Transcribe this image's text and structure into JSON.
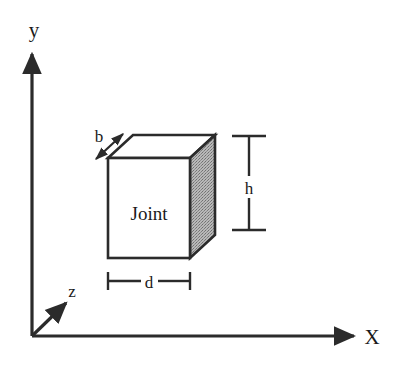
{
  "figure": {
    "background_color": "#ffffff",
    "line_color": "#2b2b2b",
    "text_color": "#1a1a1a",
    "shaded_face_color": "#a9a9a9",
    "white_face_color": "#ffffff"
  },
  "axes": {
    "origin": {
      "x": 32,
      "y": 336
    },
    "y_axis": {
      "label": "y",
      "direction": "up",
      "label_x": 34,
      "label_y": 30,
      "tip_x": 32,
      "tip_y": 50
    },
    "x_axis": {
      "label": "X",
      "direction": "right",
      "label_x": 368,
      "label_y": 344,
      "tip_x": 358,
      "tip_y": 336
    },
    "z_axis": {
      "label": "z",
      "direction": "up-right-diagonal",
      "label_x": 68,
      "label_y": 298,
      "tip_x": 70,
      "tip_y": 299
    }
  },
  "solid": {
    "name": "Joint",
    "face_label": "Joint",
    "face_label_x": 149,
    "face_label_y": 220,
    "front_face": {
      "left": 108,
      "top": 158,
      "right": 190,
      "bottom": 258,
      "fill": "#ffffff"
    },
    "depth_offset": {
      "dx": 25,
      "dy": -23
    },
    "right_face_fill": "#a9a9a9",
    "top_face_fill": "#ffffff"
  },
  "dimensions": [
    {
      "id": "b",
      "label": "b",
      "orientation": "diagonal",
      "description": "breadth along the top-left receding edge",
      "label_x": 99,
      "label_y": 141,
      "start_x": 95,
      "start_y": 160,
      "end_x": 124,
      "end_y": 133
    },
    {
      "id": "h",
      "label": "h",
      "orientation": "vertical",
      "description": "height of the joint element",
      "label_x": 249,
      "label_y": 190,
      "line_x": 249,
      "top_y": 136,
      "bottom_y": 230,
      "tick_half_width": 17
    },
    {
      "id": "d",
      "label": "d",
      "orientation": "horizontal",
      "description": "depth/width of the joint element front face",
      "label_x": 149,
      "label_y": 287,
      "line_y": 281,
      "left_x": 108,
      "right_x": 190,
      "tick_half_height": 9
    }
  ],
  "icons": {
    "y_axis_arrow": "arrow-up-icon",
    "x_axis_arrow": "arrow-right-icon",
    "z_axis_arrow": "arrow-diagonal-icon",
    "dimension_arrow": "double-arrow-icon"
  }
}
